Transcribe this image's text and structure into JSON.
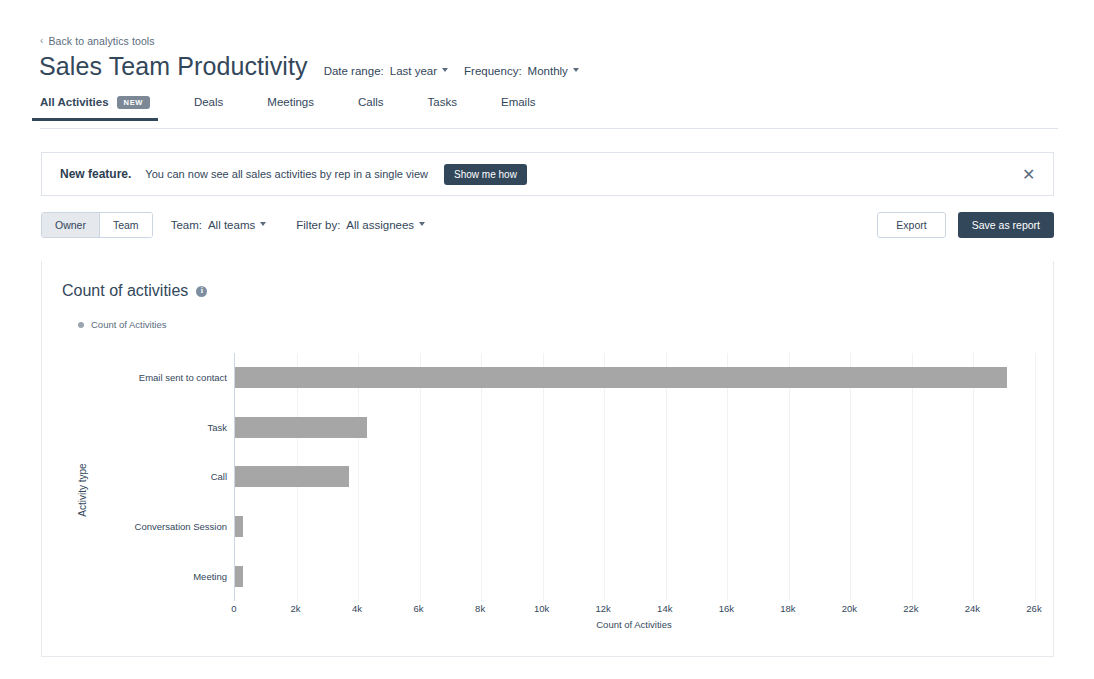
{
  "breadcrumb": {
    "chevron": "‹",
    "label": "Back to analytics tools"
  },
  "header": {
    "title": "Sales Team Productivity",
    "date_range": {
      "label": "Date range:",
      "value": "Last year"
    },
    "frequency": {
      "label": "Frequency:",
      "value": "Monthly"
    }
  },
  "tabs": [
    {
      "label": "All Activities",
      "badge": "NEW",
      "active": true
    },
    {
      "label": "Deals",
      "badge": null,
      "active": false
    },
    {
      "label": "Meetings",
      "badge": null,
      "active": false
    },
    {
      "label": "Calls",
      "badge": null,
      "active": false
    },
    {
      "label": "Tasks",
      "badge": null,
      "active": false
    },
    {
      "label": "Emails",
      "badge": null,
      "active": false
    }
  ],
  "banner": {
    "strong": "New feature.",
    "text": "You can now see all sales activities by rep in a single view",
    "button": "Show me how",
    "close_icon": "✕"
  },
  "filterbar": {
    "segments": [
      {
        "label": "Owner",
        "selected": true
      },
      {
        "label": "Team",
        "selected": false
      }
    ],
    "team_filter": {
      "label": "Team:",
      "value": "All teams"
    },
    "assignee_filter": {
      "label": "Filter by:",
      "value": "All assignees"
    },
    "export_label": "Export",
    "save_label": "Save as report"
  },
  "card": {
    "title": "Count of activities",
    "info_glyph": "i",
    "legend": "Count of Activities"
  },
  "colors": {
    "bar": "#a6a6a6",
    "primary": "#33475b",
    "border": "#dfe3eb",
    "grid": "#f0f2f5"
  },
  "chart_data": {
    "type": "bar",
    "orientation": "horizontal",
    "title": "Count of activities",
    "xlabel": "Count of Activities",
    "ylabel": "Activity type",
    "legend": [
      "Count of Activities"
    ],
    "legend_position": "top-left",
    "grid": true,
    "xlim": [
      0,
      26000
    ],
    "xticks": [
      0,
      2000,
      4000,
      6000,
      8000,
      10000,
      12000,
      14000,
      16000,
      18000,
      20000,
      22000,
      24000,
      26000
    ],
    "xticklabels": [
      "0",
      "2k",
      "4k",
      "6k",
      "8k",
      "10k",
      "12k",
      "14k",
      "16k",
      "18k",
      "20k",
      "22k",
      "24k",
      "26k"
    ],
    "categories": [
      "Email sent to contact",
      "Task",
      "Call",
      "Conversation Session",
      "Meeting"
    ],
    "values": [
      25100,
      4300,
      3700,
      250,
      250
    ]
  }
}
